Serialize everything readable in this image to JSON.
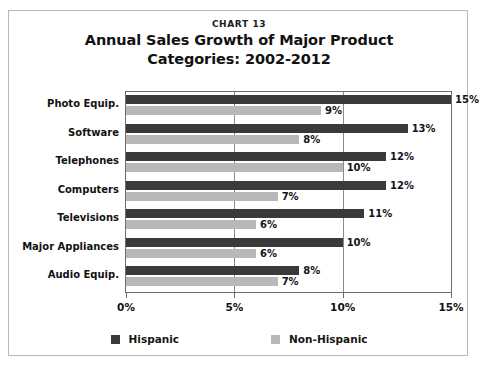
{
  "frame": {
    "chart_number": "CHART 13"
  },
  "chart_data": {
    "type": "bar",
    "orientation": "horizontal",
    "title": "Annual Sales Growth of Major Product Categories: 2002-2012",
    "title_lines": [
      "Annual Sales Growth of Major Product",
      "Categories: 2002-2012"
    ],
    "chart_number": "CHART 13",
    "xlabel": "",
    "ylabel": "",
    "categories": [
      "Photo Equip.",
      "Software",
      "Telephones",
      "Computers",
      "Televisions",
      "Major Appliances",
      "Audio Equip."
    ],
    "series": [
      {
        "name": "Hispanic",
        "color": "#3a3a3a",
        "values": [
          15,
          13,
          12,
          12,
          11,
          10,
          8
        ],
        "labels": [
          "15%",
          "13%",
          "12%",
          "12%",
          "11%",
          "10%",
          "8%"
        ]
      },
      {
        "name": "Non-Hispanic",
        "color": "#b8b8b8",
        "values": [
          9,
          8,
          10,
          7,
          6,
          6,
          7
        ],
        "labels": [
          "9%",
          "8%",
          "10%",
          "7%",
          "6%",
          "6%",
          "7%"
        ]
      }
    ],
    "xlim": [
      0,
      15
    ],
    "xticks": [
      0,
      5,
      10,
      15
    ],
    "xtick_labels": [
      "0%",
      "5%",
      "10%",
      "15%"
    ],
    "gridlines": [
      5,
      10
    ],
    "grid": true,
    "legend_position": "bottom-center"
  }
}
